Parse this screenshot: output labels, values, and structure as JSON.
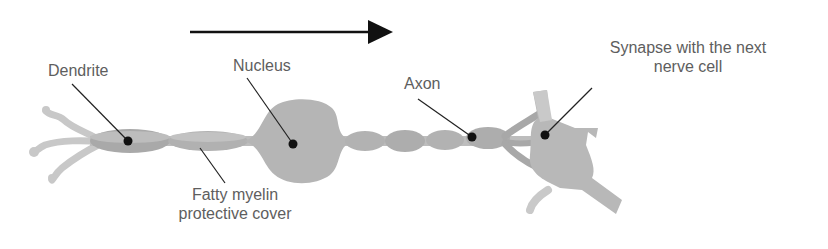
{
  "diagram": {
    "direction_arrow": "signal direction",
    "colors": {
      "background": "#ffffff",
      "cell_light": "#c6c6c6",
      "cell_mid": "#b2b2b2",
      "cell_dark": "#9a9a9a",
      "label_text": "#5e5e5e",
      "leader_line": "#222222",
      "arrow": "#111111"
    },
    "labels": {
      "dendrite": "Dendrite",
      "nucleus": "Nucleus",
      "axon": "Axon",
      "synapse_line1": "Synapse with the next",
      "synapse_line2": "nerve cell",
      "myelin_line1": "Fatty myelin",
      "myelin_line2": "protective cover"
    }
  }
}
